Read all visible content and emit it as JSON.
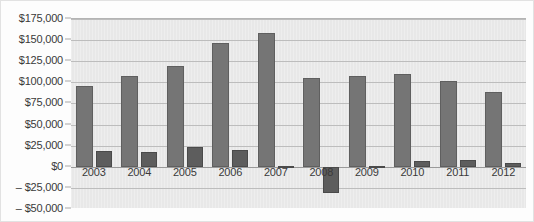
{
  "chart_data": {
    "type": "bar",
    "title": "",
    "xlabel": "",
    "ylabel": "",
    "grid": true,
    "legend_position": "none",
    "ylim": [
      -50000,
      175000
    ],
    "ytick_labels": [
      "$175,000",
      "$150,000",
      "$125,000",
      "$100,000",
      "$75,000",
      "$50,000",
      "$25,000",
      "$0",
      "– $25,000",
      "– $50,000"
    ],
    "ytick_values": [
      175000,
      150000,
      125000,
      100000,
      75000,
      50000,
      25000,
      0,
      -25000,
      -50000
    ],
    "categories": [
      "2003",
      "2004",
      "2005",
      "2006",
      "2007",
      "2008",
      "2009",
      "2010",
      "2011",
      "2012"
    ],
    "series": [
      {
        "name": "series-1",
        "color": "#757575",
        "values": [
          96000,
          108000,
          119000,
          147000,
          158000,
          105000,
          107000,
          110000,
          101000,
          89000
        ]
      },
      {
        "name": "series-2",
        "color": "#5d5d5d",
        "values": [
          19000,
          18000,
          23000,
          20000,
          1500,
          -31000,
          1000,
          7000,
          8000,
          5000
        ]
      }
    ]
  },
  "colors": {
    "plot_background": "#e8e8e8",
    "gridline": "#bdbdbd",
    "zero_line": "#9a9a9a",
    "axis_text": "#3a3a3a"
  }
}
